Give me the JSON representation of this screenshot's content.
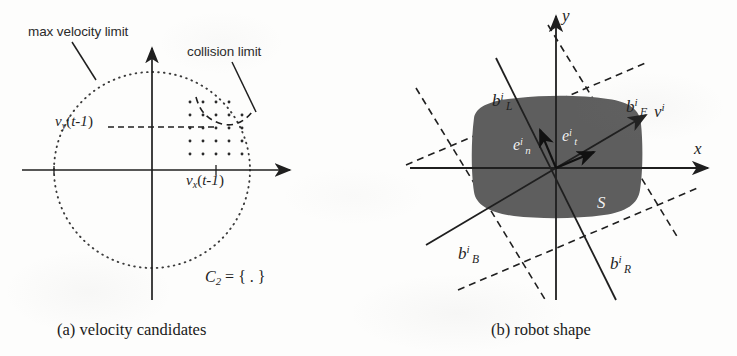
{
  "figure": {
    "background_color": "#fdfdfc",
    "ink_color": "#1f1f1f",
    "robot_fill_color": "#5e5e5e",
    "white_text_color": "#f2f2f2"
  },
  "panel_a": {
    "caption": "(a) velocity candidates",
    "annotations": {
      "max_velocity_limit": "max velocity limit",
      "collision_limit": "collision limit"
    },
    "axis_labels": {
      "vy": {
        "base": "v",
        "sub": "y",
        "arg": "(t-1)"
      },
      "vx": {
        "base": "v",
        "sub": "x",
        "arg": "(t-1)"
      }
    },
    "set_notation": {
      "base": "C",
      "sub": "2",
      "rest": " = { . }"
    },
    "candidate_grid": {
      "columns": 7,
      "rows": 5,
      "dot_color": "#2a2a2a"
    }
  },
  "panel_b": {
    "caption": "(b) robot shape",
    "axis_labels": {
      "x": "x",
      "y": "y"
    },
    "vectors": [
      {
        "name": "velocity",
        "base": "v",
        "sup": "i"
      },
      {
        "name": "normal-unit",
        "base": "e",
        "sup": "i",
        "sub": "n"
      },
      {
        "name": "tangent-unit",
        "base": "e",
        "sup": "i",
        "sub": "t"
      }
    ],
    "bound_labels": [
      {
        "id": "left",
        "base": "b",
        "sup": "i",
        "sub": "L"
      },
      {
        "id": "front",
        "base": "b",
        "sup": "i",
        "sub": "F"
      },
      {
        "id": "back",
        "base": "b",
        "sup": "i",
        "sub": "B"
      },
      {
        "id": "right",
        "base": "b",
        "sup": "i",
        "sub": "R"
      }
    ],
    "shape_label": "S"
  }
}
